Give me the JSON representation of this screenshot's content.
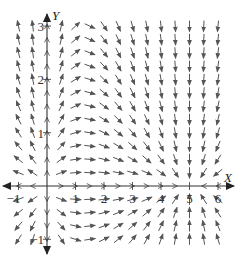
{
  "figure": {
    "type": "direction-field",
    "title": "",
    "x_axis_label": "X",
    "y_axis_label": "Y",
    "x_ticks": [
      {
        "value": -1,
        "label": "−1"
      },
      {
        "value": 1,
        "label": "1"
      },
      {
        "value": 2,
        "label": "2"
      },
      {
        "value": 3,
        "label": "3"
      },
      {
        "value": 4,
        "label": "4"
      },
      {
        "value": 5,
        "label": "5"
      },
      {
        "value": 6,
        "label": "6"
      }
    ],
    "y_ticks": [
      {
        "value": -1,
        "label": "−1"
      },
      {
        "value": 1,
        "label": "1"
      },
      {
        "value": 2,
        "label": "2"
      },
      {
        "value": 3,
        "label": "3"
      }
    ],
    "x_range": [
      -1.5,
      6.5
    ],
    "y_range": [
      -1.25,
      3.3
    ],
    "grid_step_x": 0.5,
    "grid_step_y": 0.25,
    "equilibria": [
      [
        0,
        0
      ],
      [
        5,
        0
      ]
    ],
    "colors": {
      "axis": "#333333",
      "arrow": "#555555",
      "text": "#222222"
    }
  },
  "pixel_frame": {
    "origin_px": [
      47,
      186
    ],
    "unit_x_px": 28.5,
    "unit_y_px": 53.3
  }
}
